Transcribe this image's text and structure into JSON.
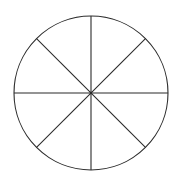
{
  "figure": {
    "name": "fraction-circle-eighths",
    "background_color": "#ffffff",
    "stroke_color": "#2b2b2b",
    "fill_color": "#ffffff",
    "stroke_width": 1.1,
    "canvas": {
      "width": 182,
      "height": 183
    }
  },
  "chart_data": {
    "type": "pie",
    "xlabel": "",
    "ylabel": "",
    "categories": [
      "sector-1",
      "sector-2",
      "sector-3",
      "sector-4",
      "sector-5",
      "sector-6",
      "sector-7",
      "sector-8"
    ],
    "values": [
      12.5,
      12.5,
      12.5,
      12.5,
      12.5,
      12.5,
      12.5,
      12.5
    ],
    "value_unit": "percent",
    "slice_fraction": "1/8",
    "slice_angle_degrees": 45,
    "total_slices": 8,
    "legend": false,
    "grid": false,
    "labels_shown": false,
    "slice_fill": "#ffffff",
    "slice_stroke": "#2b2b2b",
    "geometry": {
      "center_x": 91,
      "center_y": 93,
      "radius": 77,
      "divider_angles_degrees": [
        0,
        45,
        90,
        135
      ],
      "diameter_count": 4
    }
  },
  "dividers": [
    {
      "name": "divider-vertical",
      "angle_degrees": 90,
      "x1": 91,
      "y1": 16,
      "x2": 91,
      "y2": 170
    },
    {
      "name": "divider-horizontal",
      "angle_degrees": 0,
      "x1": 14,
      "y1": 93,
      "x2": 168,
      "y2": 93
    },
    {
      "name": "divider-diagonal-nwse",
      "angle_degrees": 135,
      "x1": 36.55,
      "y1": 38.55,
      "x2": 145.45,
      "y2": 147.45
    },
    {
      "name": "divider-diagonal-nesw",
      "angle_degrees": 45,
      "x1": 145.45,
      "y1": 38.55,
      "x2": 36.55,
      "y2": 147.45
    }
  ]
}
